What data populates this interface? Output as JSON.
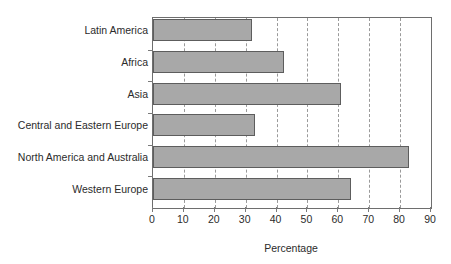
{
  "chart_data": {
    "type": "bar",
    "orientation": "horizontal",
    "title": "",
    "xlabel": "Percentage",
    "ylabel": "",
    "xlim": [
      0,
      90
    ],
    "xticks": [
      0,
      10,
      20,
      30,
      40,
      50,
      60,
      70,
      80,
      90
    ],
    "grid": "vertical-dashed",
    "legend": "none",
    "categories": [
      "Latin America",
      "Africa",
      "Asia",
      "Central and Eastern Europe",
      "North America and Australia",
      "Western Europe"
    ],
    "values": [
      32,
      42.5,
      61,
      33,
      83,
      64
    ],
    "bar_fill_color": "#a8a8a8",
    "bar_border_color": "#5d5d5d",
    "axis_color": "#6e6e6e",
    "gridline_color": "#9a9a9a",
    "text_color": "#2b2b2b"
  }
}
